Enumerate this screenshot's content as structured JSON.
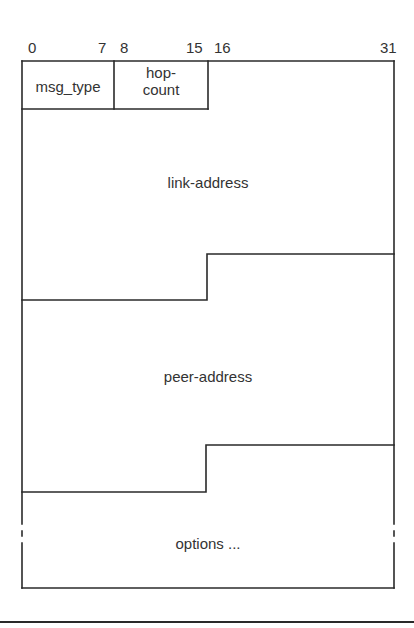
{
  "diagram": {
    "bit_labels": [
      {
        "text": "0",
        "x": 28
      },
      {
        "text": "7",
        "x": 98
      },
      {
        "text": "8",
        "x": 120
      },
      {
        "text": "15",
        "x": 186
      },
      {
        "text": "16",
        "x": 214
      },
      {
        "text": "31",
        "x": 380
      }
    ],
    "fields": {
      "msg_type": "msg_type",
      "hop_count_line1": "hop-",
      "hop_count_line2": "count",
      "link_address": "link-address",
      "peer_address": "peer-address",
      "options": "options ..."
    },
    "line_color": "#2a2a2a"
  }
}
